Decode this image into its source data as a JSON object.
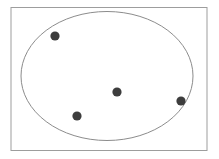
{
  "figure": {
    "kind": "set-diagram",
    "canvas": {
      "width": 219,
      "height": 159,
      "background_color": "#ffffff"
    },
    "frame": {
      "label": "universe-rectangle",
      "x": 11,
      "y": 7.5,
      "width": 196,
      "height": 143,
      "stroke_color": "#9d9d9d",
      "stroke_width": 1,
      "fill": "none"
    },
    "set": {
      "label": "set-ellipse",
      "cx": 107,
      "cy": 76,
      "rx": 86,
      "ry": 64.5,
      "stroke_color": "#8c8c8c",
      "stroke_width": 1,
      "fill": "none"
    },
    "dots": {
      "fill_color": "#3d3d3d",
      "radius": 4.6,
      "count": 4,
      "items": [
        {
          "name": "dot-upper-left",
          "cx": 55,
          "cy": 36,
          "inside_set": true
        },
        {
          "name": "dot-center",
          "cx": 117,
          "cy": 92,
          "inside_set": true
        },
        {
          "name": "dot-lower-left",
          "cx": 77,
          "cy": 116,
          "inside_set": true
        },
        {
          "name": "dot-right",
          "cx": 181,
          "cy": 101,
          "inside_set": true
        }
      ]
    }
  }
}
